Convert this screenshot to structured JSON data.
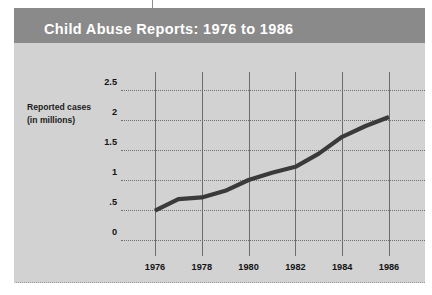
{
  "title": "Child Abuse Reports: 1976 to 1986",
  "axis_caption_line1": "Reported cases",
  "axis_caption_line2": "(in millions)",
  "colors": {
    "title_bar": "#8a8a8a",
    "title_text": "#ffffff",
    "panel": "#d2d2d2",
    "line": "#3a3a3a",
    "gridline": "#6f6f6f",
    "axis_line": "#6d6d6d",
    "page_background": "#ffffff"
  },
  "chart_data": {
    "type": "line",
    "title": "Child Abuse Reports: 1976 to 1986",
    "xlabel": "",
    "ylabel": "Reported cases (in millions)",
    "x": [
      1976,
      1977,
      1978,
      1979,
      1980,
      1981,
      1982,
      1983,
      1984,
      1985,
      1986
    ],
    "values": [
      0.49,
      0.68,
      0.71,
      0.82,
      1.0,
      1.12,
      1.22,
      1.44,
      1.72,
      1.9,
      2.05
    ],
    "xtick_labels": [
      "1976",
      "1978",
      "1980",
      "1982",
      "1984",
      "1986"
    ],
    "xtick_values": [
      1976,
      1978,
      1980,
      1982,
      1984,
      1986
    ],
    "ytick_labels": [
      "2.5",
      "2",
      "1.5",
      "1",
      ".5",
      "0"
    ],
    "ytick_values": [
      2.5,
      2,
      1.5,
      1,
      0.5,
      0
    ],
    "xlim": [
      1976,
      1986
    ],
    "ylim": [
      0,
      2.5
    ],
    "grid": "horizontal-dotted-and-vertical-solid",
    "legend": "none",
    "series_name": "Reported cases (in millions)"
  }
}
